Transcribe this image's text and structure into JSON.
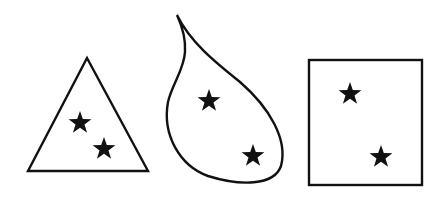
{
  "figure": {
    "shapes": [
      {
        "name": "triangle",
        "star_count": 2
      },
      {
        "name": "teardrop",
        "star_count": 2
      },
      {
        "name": "rectangle",
        "star_count": 2
      }
    ],
    "colors": {
      "stroke": "#111111",
      "background": "#ffffff"
    }
  }
}
